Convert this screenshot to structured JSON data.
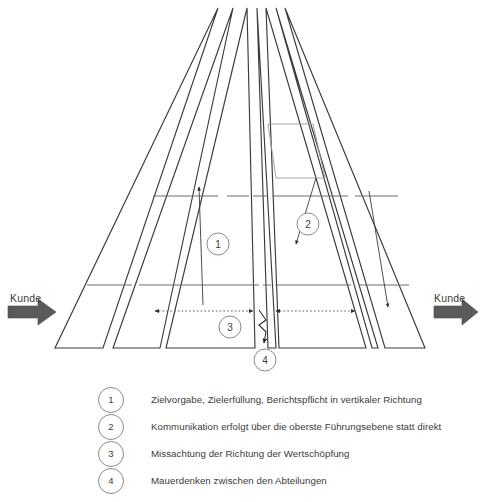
{
  "diagram": {
    "customer_left_label": "Kunde",
    "customer_right_label": "Kunde",
    "colors": {
      "outline": "#3b3b3b",
      "divider": "#6d6d6d",
      "marker_ring": "#8a8a8a",
      "block_arrow": "#5a5a5a",
      "text": "#3b3b3b",
      "background": "#ffffff"
    },
    "markers": [
      {
        "id": "1",
        "x": 218,
        "y": 244
      },
      {
        "id": "2",
        "x": 308,
        "y": 224
      },
      {
        "id": "3",
        "x": 230,
        "y": 327
      },
      {
        "id": "4",
        "x": 265,
        "y": 360
      }
    ],
    "pillar_count": 4,
    "level_count": 3
  },
  "legend": {
    "items": [
      {
        "number": "1",
        "text": "Zielvorgabe, Zielerfüllung, Berichtspflicht in vertikaler Richtung"
      },
      {
        "number": "2",
        "text": "Kommunikation erfolgt über die oberste Führungsebene statt direkt"
      },
      {
        "number": "3",
        "text": "Missachtung der Richtung der Wertschöpfung"
      },
      {
        "number": "4",
        "text": "Mauerdenken zwischen den Abteilungen"
      }
    ]
  }
}
